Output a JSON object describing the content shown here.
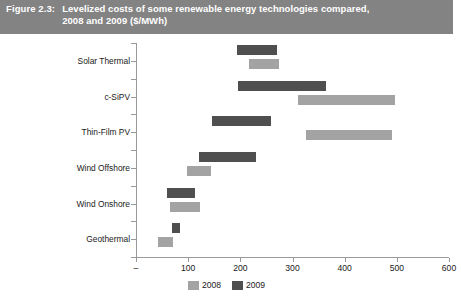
{
  "figure": {
    "number": "Figure 2.3:",
    "caption_line1": "Levelized costs of some renewable energy technologies compared,",
    "caption_line2": "2008 and 2009 ($/MWh)",
    "banner_color": "#838383",
    "banner_text_color": "#ffffff"
  },
  "legend": {
    "position": "bottom-center",
    "items": [
      {
        "label": "2008",
        "color": "#a3a3a3"
      },
      {
        "label": "2009",
        "color": "#4f4f4f"
      }
    ]
  },
  "chart_data": {
    "type": "bar",
    "subtype": "floating-range-bar",
    "title": "Levelized costs of some renewable energy technologies compared, 2008 and 2009 ($/MWh)",
    "xlabel": "",
    "ylabel": "",
    "xlim": [
      0,
      600
    ],
    "xticks": [
      0,
      100,
      200,
      300,
      400,
      500,
      600
    ],
    "xtick_labels": [
      "–",
      "100",
      "200",
      "300",
      "400",
      "500",
      "600"
    ],
    "grid": false,
    "categories": [
      "Solar Thermal",
      "c-SiPV",
      "Thin-Film PV",
      "Wind Offshore",
      "Wind Onshore",
      "Geothermal"
    ],
    "series": [
      {
        "name": "2009",
        "color": "#4f4f4f",
        "ranges": [
          {
            "category": "Solar Thermal",
            "low": 193,
            "high": 270
          },
          {
            "category": "c-SiPV",
            "low": 196,
            "high": 364
          },
          {
            "category": "Thin-Film PV",
            "low": 145,
            "high": 258
          },
          {
            "category": "Wind Offshore",
            "low": 120,
            "high": 230
          },
          {
            "category": "Wind Onshore",
            "low": 60,
            "high": 114
          },
          {
            "category": "Geothermal",
            "low": 69,
            "high": 85
          }
        ]
      },
      {
        "name": "2008",
        "color": "#a3a3a3",
        "ranges": [
          {
            "category": "Solar Thermal",
            "low": 216,
            "high": 274
          },
          {
            "category": "c-SiPV",
            "low": 310,
            "high": 496
          },
          {
            "category": "Thin-Film PV",
            "low": 326,
            "high": 490
          },
          {
            "category": "Wind Offshore",
            "low": 98,
            "high": 144
          },
          {
            "category": "Wind Onshore",
            "low": 66,
            "high": 123
          },
          {
            "category": "Geothermal",
            "low": 42,
            "high": 71
          }
        ]
      }
    ]
  }
}
